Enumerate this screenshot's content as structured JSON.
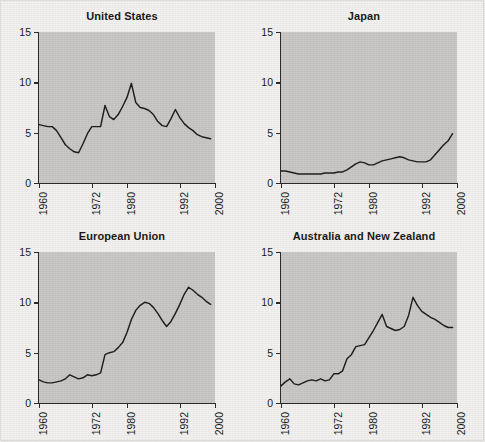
{
  "figure": {
    "background_color": "#f3f2f0",
    "panel_background_color": "#c9c8c6",
    "line_color": "#1f1f1f",
    "axis_color": "#2b2b2b"
  },
  "chart_data": [
    {
      "type": "line",
      "title": "United States",
      "xlabel": "",
      "ylabel": "",
      "xlim": [
        1960,
        2000
      ],
      "ylim": [
        0,
        15
      ],
      "xticks": [
        1960,
        1972,
        1980,
        1992,
        2000
      ],
      "xticklabels": [
        "1960",
        "1972",
        "1980",
        "1992",
        "2000"
      ],
      "yticks": [
        0,
        5,
        10,
        15
      ],
      "yticklabels": [
        "0",
        "5",
        "10",
        "15"
      ],
      "grid": false,
      "legend": "none",
      "x": [
        1960,
        1961,
        1962,
        1963,
        1964,
        1965,
        1966,
        1967,
        1968,
        1969,
        1970,
        1971,
        1972,
        1973,
        1974,
        1975,
        1976,
        1977,
        1978,
        1979,
        1980,
        1981,
        1982,
        1983,
        1984,
        1985,
        1986,
        1987,
        1988,
        1989,
        1990,
        1991,
        1992,
        1993,
        1994,
        1995,
        1996,
        1997,
        1998,
        1999
      ],
      "values": [
        5.8,
        5.7,
        5.6,
        5.6,
        5.2,
        4.5,
        3.8,
        3.4,
        3.1,
        3.0,
        3.9,
        4.9,
        5.6,
        5.6,
        5.6,
        7.7,
        6.6,
        6.3,
        6.8,
        7.6,
        8.5,
        9.9,
        8.0,
        7.5,
        7.4,
        7.2,
        6.8,
        6.1,
        5.7,
        5.6,
        6.4,
        7.3,
        6.5,
        5.9,
        5.5,
        5.2,
        4.8,
        4.6,
        4.5,
        4.4
      ]
    },
    {
      "type": "line",
      "title": "Japan",
      "xlabel": "",
      "ylabel": "",
      "xlim": [
        1960,
        2000
      ],
      "ylim": [
        0,
        15
      ],
      "xticks": [
        1960,
        1972,
        1980,
        1992,
        2000
      ],
      "xticklabels": [
        "1960",
        "1972",
        "1980",
        "1992",
        "2000"
      ],
      "yticks": [
        0,
        5,
        10,
        15
      ],
      "yticklabels": [
        "0",
        "5",
        "10",
        "15"
      ],
      "grid": false,
      "legend": "none",
      "x": [
        1960,
        1961,
        1962,
        1963,
        1964,
        1965,
        1966,
        1967,
        1968,
        1969,
        1970,
        1971,
        1972,
        1973,
        1974,
        1975,
        1976,
        1977,
        1978,
        1979,
        1980,
        1981,
        1982,
        1983,
        1984,
        1985,
        1986,
        1987,
        1988,
        1989,
        1990,
        1991,
        1992,
        1993,
        1994,
        1995,
        1996,
        1997,
        1998,
        1999
      ],
      "values": [
        1.2,
        1.2,
        1.1,
        1.0,
        0.9,
        0.9,
        0.9,
        0.9,
        0.9,
        0.9,
        1.0,
        1.0,
        1.0,
        1.1,
        1.1,
        1.3,
        1.6,
        1.9,
        2.1,
        2.0,
        1.8,
        1.8,
        2.0,
        2.2,
        2.3,
        2.4,
        2.5,
        2.6,
        2.5,
        2.3,
        2.2,
        2.1,
        2.1,
        2.1,
        2.3,
        2.8,
        3.3,
        3.8,
        4.2,
        4.9
      ]
    },
    {
      "type": "line",
      "title": "European Union",
      "xlabel": "",
      "ylabel": "",
      "xlim": [
        1960,
        2000
      ],
      "ylim": [
        0,
        15
      ],
      "xticks": [
        1960,
        1972,
        1980,
        1992,
        2000
      ],
      "xticklabels": [
        "1960",
        "1972",
        "1980",
        "1992",
        "2000"
      ],
      "yticks": [
        0,
        5,
        10,
        15
      ],
      "yticklabels": [
        "0",
        "5",
        "10",
        "15"
      ],
      "grid": false,
      "legend": "none",
      "x": [
        1960,
        1961,
        1962,
        1963,
        1964,
        1965,
        1966,
        1967,
        1968,
        1969,
        1970,
        1971,
        1972,
        1973,
        1974,
        1975,
        1976,
        1977,
        1978,
        1979,
        1980,
        1981,
        1982,
        1983,
        1984,
        1985,
        1986,
        1987,
        1988,
        1989,
        1990,
        1991,
        1992,
        1993,
        1994,
        1995,
        1996,
        1997,
        1998,
        1999
      ],
      "values": [
        2.3,
        2.1,
        2.0,
        2.0,
        2.1,
        2.2,
        2.4,
        2.8,
        2.6,
        2.4,
        2.5,
        2.8,
        2.7,
        2.8,
        3.0,
        4.8,
        5.0,
        5.1,
        5.5,
        6.0,
        7.0,
        8.3,
        9.2,
        9.7,
        10.0,
        9.9,
        9.5,
        8.9,
        8.2,
        7.6,
        8.1,
        8.9,
        9.8,
        10.8,
        11.5,
        11.2,
        10.8,
        10.5,
        10.1,
        9.8
      ]
    },
    {
      "type": "line",
      "title": "Australia and New Zealand",
      "xlabel": "",
      "ylabel": "",
      "xlim": [
        1960,
        2000
      ],
      "ylim": [
        0,
        15
      ],
      "xticks": [
        1960,
        1972,
        1980,
        1992,
        2000
      ],
      "xticklabels": [
        "1960",
        "1972",
        "1980",
        "1992",
        "2000"
      ],
      "yticks": [
        0,
        5,
        10,
        15
      ],
      "yticklabels": [
        "0",
        "5",
        "10",
        "15"
      ],
      "grid": false,
      "legend": "none",
      "x": [
        1960,
        1961,
        1962,
        1963,
        1964,
        1965,
        1966,
        1967,
        1968,
        1969,
        1970,
        1971,
        1972,
        1973,
        1974,
        1975,
        1976,
        1977,
        1978,
        1979,
        1980,
        1981,
        1982,
        1983,
        1984,
        1985,
        1986,
        1987,
        1988,
        1989,
        1990,
        1991,
        1992,
        1993,
        1994,
        1995,
        1996,
        1997,
        1998,
        1999
      ],
      "values": [
        1.7,
        2.1,
        2.4,
        1.9,
        1.8,
        2.0,
        2.2,
        2.3,
        2.2,
        2.4,
        2.2,
        2.3,
        2.9,
        2.9,
        3.2,
        4.4,
        4.8,
        5.6,
        5.7,
        5.8,
        6.5,
        7.2,
        8.0,
        8.8,
        7.6,
        7.4,
        7.2,
        7.3,
        7.6,
        8.7,
        10.5,
        9.7,
        9.1,
        8.8,
        8.5,
        8.3,
        8.0,
        7.7,
        7.5,
        7.5
      ]
    }
  ]
}
